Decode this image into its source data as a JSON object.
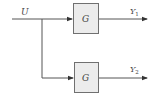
{
  "diagram": {
    "input": {
      "label": "U"
    },
    "blocks": [
      {
        "label": "G"
      },
      {
        "label": "G"
      }
    ],
    "outputs": [
      {
        "label": "Y",
        "sub": "1"
      },
      {
        "label": "Y",
        "sub": "2"
      }
    ],
    "colors": {
      "line": "#555555",
      "block_fill": "#ececec",
      "block_border": "#707070",
      "text": "#444444"
    }
  }
}
